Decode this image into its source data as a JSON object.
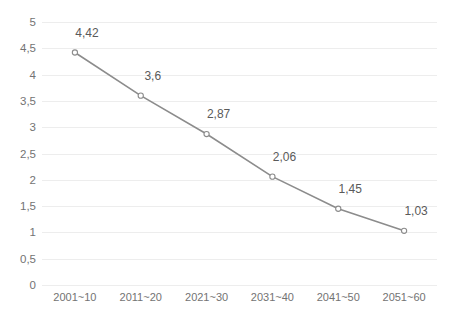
{
  "chart_data": {
    "type": "line",
    "title": "",
    "xlabel": "",
    "ylabel": "",
    "categories": [
      "2001~10",
      "2011~20",
      "2021~30",
      "2031~40",
      "2041~50",
      "2051~60"
    ],
    "values": [
      4.42,
      3.6,
      2.87,
      2.06,
      1.45,
      1.03
    ],
    "point_labels": [
      "4,42",
      "3,6",
      "2,87",
      "2,06",
      "1,45",
      "1,03"
    ],
    "ylim": [
      0,
      5
    ],
    "ytick_values": [
      5,
      4.5,
      4,
      3.5,
      3,
      2.5,
      2,
      1.5,
      1,
      0.5,
      0
    ],
    "ytick_labels": [
      "5",
      "4,5",
      "4",
      "3,5",
      "3",
      "2,5",
      "2",
      "1,5",
      "1",
      "0,5",
      "0"
    ],
    "decimal_separator": ",",
    "grid": "horizontal",
    "legend": "none",
    "series_color": "#8c8c8c",
    "marker": "open-circle",
    "marker_fill": "#ffffff",
    "gridline_color": "#ededed",
    "axis_text_color": "#737373",
    "label_text_color": "#5a5a5a",
    "background": "#ffffff"
  }
}
